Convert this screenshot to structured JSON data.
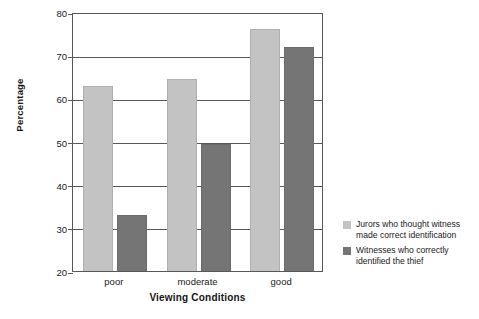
{
  "chart_data": {
    "type": "bar",
    "title": "",
    "xlabel": "Viewing Conditions",
    "ylabel": "Percentage",
    "categories": [
      "poor",
      "moderate",
      "good"
    ],
    "ylim": [
      20,
      80
    ],
    "yticks": [
      20,
      30,
      40,
      50,
      60,
      70,
      80
    ],
    "ytick_labels": [
      "20",
      "30",
      "40",
      "50",
      "60",
      "70",
      "80"
    ],
    "grid": true,
    "legend_position": "right",
    "series": [
      {
        "name": "Jurors who thought witness made correct identification",
        "color": "#c3c3c3",
        "values": [
          62.8,
          64.5,
          76.0
        ]
      },
      {
        "name": "Witnesses who correctly identified the thief",
        "color": "#757575",
        "values": [
          33.0,
          49.5,
          72.0
        ]
      }
    ]
  },
  "legend": {
    "items": [
      {
        "line1": "Jurors who thought witness",
        "line2": "made correct identification"
      },
      {
        "line1": "Witnesses who correctly",
        "line2": "identified the thief"
      }
    ]
  }
}
